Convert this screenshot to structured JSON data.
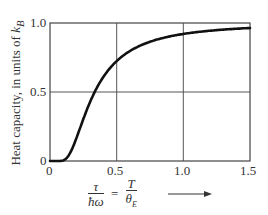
{
  "chart_data": {
    "type": "line",
    "title": "",
    "xlabel": "τ/ħω = T/θ_E",
    "ylabel": "Heat capacity, in units of k_B",
    "xlim": [
      0,
      1.5
    ],
    "ylim": [
      0,
      1.0
    ],
    "grid": true,
    "x_ticks": [
      "0",
      "0.5",
      "1.0",
      "1.5"
    ],
    "y_ticks": [
      "0",
      "0.5",
      "1.0"
    ],
    "series": [
      {
        "name": "Einstein heat capacity",
        "x": [
          0,
          0.05,
          0.1,
          0.15,
          0.2,
          0.25,
          0.3,
          0.35,
          0.4,
          0.5,
          0.6,
          0.7,
          0.8,
          0.9,
          1.0,
          1.1,
          1.2,
          1.3,
          1.4,
          1.5
        ],
        "values": [
          0,
          0.0,
          0.005,
          0.056,
          0.171,
          0.304,
          0.427,
          0.528,
          0.609,
          0.724,
          0.799,
          0.847,
          0.88,
          0.903,
          0.921,
          0.934,
          0.944,
          0.952,
          0.958,
          0.963
        ]
      }
    ]
  },
  "labels": {
    "ylabel_main": "Heat capacity, in units of ",
    "ylabel_sym": "k",
    "ylabel_sub": "B",
    "x_num1": "τ",
    "x_den1": "ħω",
    "x_eq": "=",
    "x_num2": "T",
    "x_den2": "θ",
    "x_den2_sub": "E",
    "xtick_0": "0",
    "xtick_1": "0.5",
    "xtick_2": "1.0",
    "xtick_3": "1.5",
    "ytick_0": "0",
    "ytick_1": "0.5",
    "ytick_2": "1.0"
  }
}
